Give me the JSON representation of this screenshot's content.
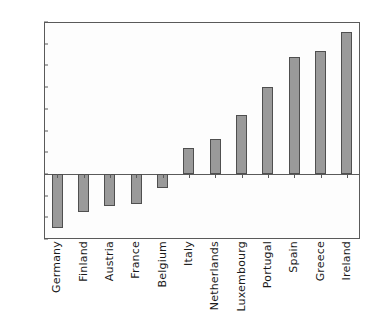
{
  "chart_data": {
    "type": "bar",
    "title": "",
    "subtitle": "",
    "xlabel": "",
    "ylabel": "",
    "categories": [
      "Germany",
      "Finland",
      "Austria",
      "France",
      "Belgium",
      "Italy",
      "Netherlands",
      "Luxembourg",
      "Portugal",
      "Spain",
      "Greece",
      "Ireland"
    ],
    "values": [
      -5.0,
      -3.5,
      -3.0,
      -2.8,
      -1.3,
      2.4,
      3.2,
      5.4,
      8.0,
      10.8,
      11.3,
      13.1
    ],
    "ylim": [
      -6,
      14
    ],
    "yticks": [
      -6,
      -4,
      -2,
      0,
      2,
      4,
      6,
      8,
      10,
      12,
      14
    ],
    "ytick_labels": [
      "-6",
      "-4",
      "-2",
      "0",
      "2",
      "4",
      "6",
      "8",
      "10",
      "12",
      "14"
    ],
    "grid": false,
    "legend": null,
    "legend_position": "none",
    "bar_color": "#9a9a9a",
    "bar_edge_color": "#4f4f4f",
    "axis_color": "#5a5a5a",
    "background_color": "#ffffff"
  }
}
